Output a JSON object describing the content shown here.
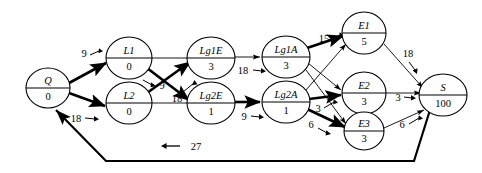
{
  "diagram": {
    "title": "",
    "type": "directed-network-flow-graph",
    "colors": {
      "stroke": "#000000",
      "background": "#ffffff"
    },
    "nodes": [
      {
        "id": "Q",
        "label": "Q",
        "value": "0",
        "cx": 48,
        "cy": 88,
        "rx": 22,
        "ry": 20
      },
      {
        "id": "L1",
        "label": "L1",
        "value": "0",
        "cx": 129,
        "cy": 58,
        "rx": 23,
        "ry": 21
      },
      {
        "id": "L2",
        "label": "L2",
        "value": "0",
        "cx": 129,
        "cy": 103,
        "rx": 23,
        "ry": 21
      },
      {
        "id": "Lg1E",
        "label": "Lg1E",
        "value": "3",
        "cx": 211,
        "cy": 58,
        "rx": 24,
        "ry": 21
      },
      {
        "id": "Lg2E",
        "label": "Lg2E",
        "value": "1",
        "cx": 211,
        "cy": 103,
        "rx": 24,
        "ry": 21
      },
      {
        "id": "Lg1A",
        "label": "Lg1A",
        "value": "3",
        "cx": 286,
        "cy": 57,
        "rx": 24,
        "ry": 21
      },
      {
        "id": "Lg2A",
        "label": "Lg2A",
        "value": "1",
        "cx": 286,
        "cy": 102,
        "rx": 24,
        "ry": 21
      },
      {
        "id": "E1",
        "label": "E1",
        "value": "5",
        "cx": 364,
        "cy": 33,
        "rx": 22,
        "ry": 21
      },
      {
        "id": "E2",
        "label": "E2",
        "value": "3",
        "cx": 364,
        "cy": 93,
        "rx": 22,
        "ry": 21
      },
      {
        "id": "E3",
        "label": "E3",
        "value": "3",
        "cx": 364,
        "cy": 131,
        "rx": 20,
        "ry": 19
      },
      {
        "id": "S",
        "label": "S",
        "value": "100",
        "cx": 443,
        "cy": 95,
        "rx": 24,
        "ry": 21
      }
    ],
    "edges": [
      {
        "from": "Q",
        "to": "L1",
        "label": "9",
        "weight": "bold"
      },
      {
        "from": "Q",
        "to": "L2",
        "label": "18",
        "weight": "bold"
      },
      {
        "from": "L1",
        "to": "Lg1E",
        "label": "",
        "weight": "thin"
      },
      {
        "from": "L1",
        "to": "Lg2E",
        "label": "9",
        "weight": "bold"
      },
      {
        "from": "L2",
        "to": "Lg1E",
        "label": "18",
        "weight": "bold"
      },
      {
        "from": "L2",
        "to": "Lg2E",
        "label": "",
        "weight": "thin"
      },
      {
        "from": "Lg1E",
        "to": "Lg1A",
        "label": "18",
        "weight": "thin"
      },
      {
        "from": "Lg2E",
        "to": "Lg2A",
        "label": "9",
        "weight": "bold"
      },
      {
        "from": "Lg1A",
        "to": "E1",
        "label": "15",
        "weight": "bold"
      },
      {
        "from": "Lg1A",
        "to": "E2",
        "label": "",
        "weight": "thin"
      },
      {
        "from": "Lg1A",
        "to": "E3",
        "label": "",
        "weight": "thin"
      },
      {
        "from": "Lg2A",
        "to": "E1",
        "label": "",
        "weight": "thin"
      },
      {
        "from": "Lg2A",
        "to": "E2",
        "label": "3",
        "weight": "bold"
      },
      {
        "from": "Lg2A",
        "to": "E3",
        "label": "6",
        "weight": "bold"
      },
      {
        "from": "E1",
        "to": "S",
        "label": "18",
        "weight": "thin"
      },
      {
        "from": "E2",
        "to": "S",
        "label": "3",
        "weight": "thin"
      },
      {
        "from": "E3",
        "to": "S",
        "label": "6",
        "weight": "thin"
      },
      {
        "from": "S",
        "to": "Q",
        "label": "27",
        "weight": "return"
      }
    ],
    "edge_labels": {
      "q_l1": "9",
      "q_l2": "18",
      "l1_lg2e": "9",
      "l2_lg1e": "18",
      "lg1e_lg1a": "18",
      "lg2e_lg2a": "9",
      "lg1a_e1": "15",
      "lg2a_e2": "3",
      "lg2a_e3": "6",
      "e1_s": "18",
      "e2_s": "3",
      "e3_s": "6",
      "return_s_q": "27"
    },
    "return_arrow_glyph": "←"
  }
}
